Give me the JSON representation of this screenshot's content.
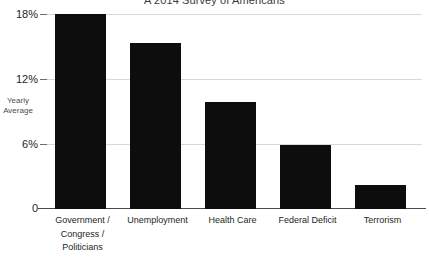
{
  "chart_data": {
    "type": "bar",
    "title": "A 2014 Survey of Americans",
    "xlabel": "",
    "ylabel": "Yearly Average",
    "ylabel_lines": [
      "Yearly",
      "Average"
    ],
    "ylim": [
      0,
      18
    ],
    "ytick_labels": [
      "18%",
      "12%",
      "6%",
      "0"
    ],
    "ytick_values": [
      18,
      12,
      6,
      0
    ],
    "grid": true,
    "legend": "none",
    "bar_color": "#0d0d0d",
    "grid_color": "#d8d8d8",
    "axis_color": "#4a4a4a",
    "categories": [
      "Government / Congress / Politicians",
      "Unemployment",
      "Health Care",
      "Federal Deficit",
      "Terrorism"
    ],
    "category_lines": [
      [
        "Government /",
        "Congress /",
        "Politicians"
      ],
      [
        "Unemployment"
      ],
      [
        "Health Care"
      ],
      [
        "Federal Deficit"
      ],
      [
        "Terrorism"
      ]
    ],
    "values": [
      18.0,
      15.3,
      9.9,
      5.9,
      2.2
    ]
  }
}
